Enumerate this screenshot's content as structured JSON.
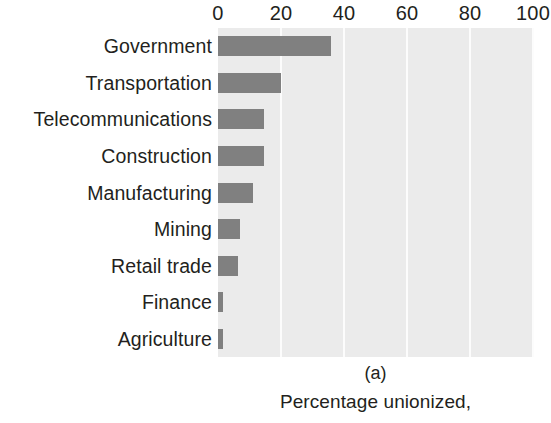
{
  "figure": {
    "panel_label": "(a)",
    "caption": "Percentage unionized,",
    "colors": {
      "bar": "#808080",
      "plot_background": "#ebebeb",
      "gridline": "#fcfcfc",
      "text": "#231f20",
      "page_background": "#ffffff"
    }
  },
  "chart_data": {
    "type": "bar",
    "orientation": "horizontal",
    "title": "Percentage unionized,",
    "subtitle": "(a)",
    "xlabel": "",
    "ylabel": "",
    "xlim": [
      0,
      100
    ],
    "grid": true,
    "legend": false,
    "xticks": [
      0,
      20,
      40,
      60,
      80,
      100
    ],
    "xtick_labels": [
      "0",
      "20",
      "40",
      "60",
      "80",
      "100"
    ],
    "categories": [
      "Government",
      "Transportation",
      "Telecommunications",
      "Construction",
      "Manufacturing",
      "Mining",
      "Retail trade",
      "Finance",
      "Agriculture"
    ],
    "values": [
      36,
      20,
      14.5,
      14.5,
      11,
      7,
      6.5,
      1.5,
      1.5
    ]
  }
}
